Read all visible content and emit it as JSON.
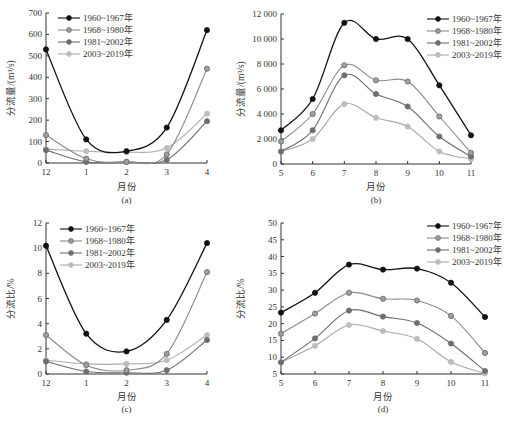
{
  "colors": {
    "s1": "#111111",
    "s2": "#8a8a8a",
    "s3": "#6e6e6e",
    "s4": "#a9a9a9",
    "axis": "#333333"
  },
  "legend": [
    "1960~1967年",
    "1968~1980年",
    "1981~2002年",
    "2003~2019年"
  ],
  "chart_data": [
    {
      "id": "a",
      "type": "line",
      "subtitle": "(a)",
      "xlabel": "月份",
      "ylabel": "分流量/(m³/s)",
      "categories": [
        "12",
        "1",
        "2",
        "3",
        "4"
      ],
      "yticks": [
        "0",
        "100",
        "200",
        "300",
        "400",
        "500",
        "600",
        "700"
      ],
      "ylim": [
        0,
        700
      ],
      "legend_position": "upper-left",
      "series": [
        {
          "name": "1960~1967年",
          "values": [
            530,
            110,
            55,
            165,
            620
          ]
        },
        {
          "name": "1968~1980年",
          "values": [
            130,
            20,
            5,
            40,
            440
          ]
        },
        {
          "name": "1981~2002年",
          "values": [
            60,
            5,
            5,
            15,
            195
          ]
        },
        {
          "name": "2003~2019年",
          "values": [
            65,
            55,
            50,
            70,
            230
          ]
        }
      ]
    },
    {
      "id": "b",
      "type": "line",
      "subtitle": "(b)",
      "xlabel": "月份",
      "ylabel": "分流量/(m³/s)",
      "categories": [
        "5",
        "6",
        "7",
        "8",
        "9",
        "10",
        "11"
      ],
      "yticks": [
        "0",
        "2 000",
        "4 000",
        "6 000",
        "8 000",
        "10 000",
        "12 000"
      ],
      "ylim": [
        0,
        12000
      ],
      "legend_position": "upper-right",
      "series": [
        {
          "name": "1960~1967年",
          "values": [
            2700,
            5200,
            11300,
            10000,
            10000,
            6300,
            2300
          ]
        },
        {
          "name": "1968~1980年",
          "values": [
            1800,
            4000,
            7900,
            6700,
            6600,
            3800,
            900
          ]
        },
        {
          "name": "1981~2002年",
          "values": [
            1000,
            2700,
            7100,
            5600,
            4600,
            2200,
            600
          ]
        },
        {
          "name": "2003~2019年",
          "values": [
            1000,
            2000,
            4800,
            3700,
            3000,
            1000,
            400
          ]
        }
      ]
    },
    {
      "id": "c",
      "type": "line",
      "subtitle": "(c)",
      "xlabel": "月份",
      "ylabel": "分流比/%",
      "categories": [
        "12",
        "1",
        "2",
        "3",
        "4"
      ],
      "yticks": [
        "0",
        "2",
        "4",
        "6",
        "8",
        "10",
        "12"
      ],
      "ylim": [
        0,
        12
      ],
      "legend_position": "upper-left",
      "series": [
        {
          "name": "1960~1967年",
          "values": [
            10.2,
            3.2,
            1.8,
            4.3,
            10.4
          ]
        },
        {
          "name": "1968~1980年",
          "values": [
            3.1,
            0.7,
            0.3,
            1.6,
            8.1
          ]
        },
        {
          "name": "1981~2002年",
          "values": [
            1.0,
            0.2,
            0.1,
            0.3,
            2.7
          ]
        },
        {
          "name": "2003~2019年",
          "values": [
            1.1,
            0.8,
            0.8,
            1.1,
            3.1
          ]
        }
      ]
    },
    {
      "id": "d",
      "type": "line",
      "subtitle": "(d)",
      "xlabel": "月份",
      "ylabel": "分流比/%",
      "categories": [
        "5",
        "6",
        "7",
        "8",
        "9",
        "10",
        "11"
      ],
      "yticks": [
        "5",
        "10",
        "15",
        "20",
        "25",
        "30",
        "35",
        "40",
        "45",
        "50"
      ],
      "ylim": [
        5,
        50
      ],
      "legend_position": "upper-right",
      "series": [
        {
          "name": "1960~1967年",
          "values": [
            23.3,
            29.2,
            37.6,
            36.1,
            36.4,
            32.2,
            22.0
          ]
        },
        {
          "name": "1968~1980年",
          "values": [
            17.0,
            23.0,
            29.2,
            27.4,
            26.9,
            22.3,
            11.3
          ]
        },
        {
          "name": "1981~2002年",
          "values": [
            8.5,
            15.6,
            23.9,
            22.1,
            20.2,
            14.1,
            5.9
          ]
        },
        {
          "name": "2003~2019年",
          "values": [
            8.5,
            13.4,
            19.6,
            17.8,
            15.5,
            8.6,
            5.2
          ]
        }
      ]
    }
  ],
  "caption": ""
}
